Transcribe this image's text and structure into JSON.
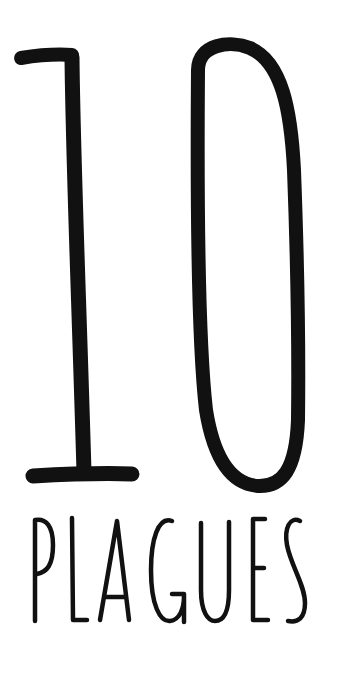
{
  "poster": {
    "number": "10",
    "word": "PLAGUES",
    "colors": {
      "background": "#ffffff",
      "ink": "#111111"
    }
  }
}
